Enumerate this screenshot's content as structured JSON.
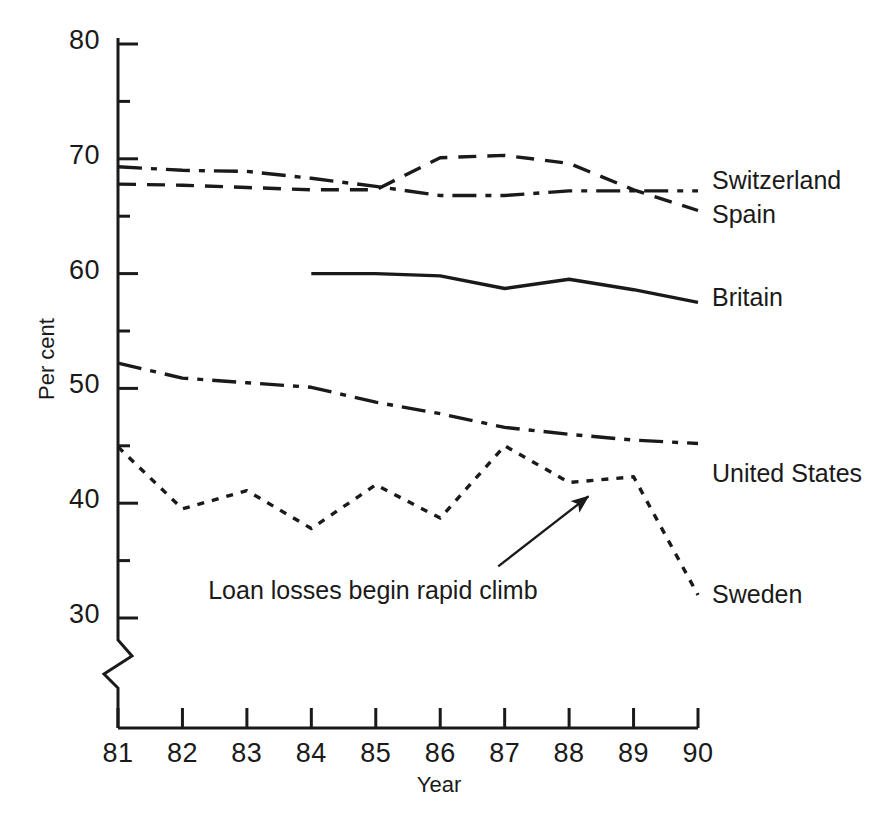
{
  "chart_data": {
    "type": "line",
    "title": "",
    "subtitle": "",
    "xlabel": "Year",
    "ylabel": "Per cent",
    "x": [
      81,
      82,
      83,
      84,
      85,
      86,
      87,
      88,
      89,
      90
    ],
    "xtick_labels": [
      "81",
      "82",
      "83",
      "84",
      "85",
      "86",
      "87",
      "88",
      "89",
      "90"
    ],
    "xlim": [
      81,
      90
    ],
    "ylim": [
      30,
      80
    ],
    "ytick_labels": [
      "30",
      "40",
      "50",
      "60",
      "70",
      "80"
    ],
    "ytick_values": [
      30,
      40,
      50,
      60,
      70,
      80
    ],
    "yminor_step": 5,
    "grid": false,
    "legend_position": "right-inline-labels",
    "axis_break": true,
    "axis_break_note": "zigzag break on y-axis below 30",
    "series": [
      {
        "name": "Switzerland",
        "style": "dash-dot",
        "x": [
          81,
          82,
          83,
          84,
          85,
          86,
          87,
          88,
          89,
          90
        ],
        "values": [
          69.3,
          69.0,
          68.9,
          68.3,
          67.6,
          66.8,
          66.8,
          67.2,
          67.2,
          67.2
        ]
      },
      {
        "name": "Spain",
        "style": "dashed",
        "x": [
          81,
          82,
          83,
          84,
          85,
          86,
          87,
          88,
          89,
          90
        ],
        "values": [
          67.8,
          67.7,
          67.5,
          67.3,
          67.3,
          70.1,
          70.3,
          69.6,
          67.3,
          65.5
        ]
      },
      {
        "name": "Britain",
        "style": "solid",
        "x": [
          84,
          85,
          86,
          87,
          88,
          89,
          90
        ],
        "values": [
          60.0,
          60.0,
          59.8,
          58.7,
          59.5,
          58.6,
          57.5
        ]
      },
      {
        "name": "United States",
        "style": "dash-dot",
        "x": [
          81,
          82,
          83,
          84,
          85,
          86,
          87,
          88,
          89,
          90
        ],
        "values": [
          52.2,
          50.9,
          50.5,
          50.1,
          48.8,
          47.8,
          46.6,
          46.0,
          45.5,
          45.2
        ]
      },
      {
        "name": "Sweden",
        "style": "dotted",
        "x": [
          81,
          82,
          83,
          84,
          85,
          86,
          87,
          88,
          89,
          90
        ],
        "values": [
          44.9,
          39.5,
          41.1,
          37.8,
          41.6,
          38.7,
          45.0,
          41.8,
          42.3,
          32.0
        ]
      }
    ],
    "annotations": [
      {
        "text": "Loan losses begin rapid climb",
        "text_x": 82.4,
        "text_y": 32.3,
        "arrow_from_x": 86.9,
        "arrow_from_y": 34.5,
        "arrow_to_x": 88.3,
        "arrow_to_y": 40.6
      }
    ]
  },
  "series_labels": {
    "switzerland": "Switzerland",
    "spain": "Spain",
    "britain": "Britain",
    "united_states": "United States",
    "sweden": "Sweden"
  },
  "axis": {
    "x_title": "Year",
    "y_title": "Per cent"
  },
  "colors": {
    "line": "#1a1a1a",
    "axis": "#1a1a1a",
    "background": "#ffffff"
  }
}
